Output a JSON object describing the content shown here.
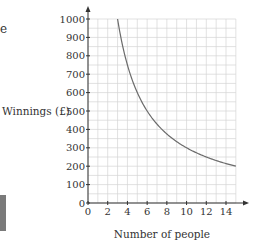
{
  "fragments": {
    "top_left_text": "e"
  },
  "chart_data": {
    "type": "line",
    "title": "",
    "xlabel": "Number of people",
    "ylabel": "Winnings (£)",
    "xlim": [
      0,
      15
    ],
    "ylim": [
      0,
      1000
    ],
    "xticks": [
      0,
      2,
      4,
      6,
      8,
      10,
      12,
      14
    ],
    "yticks": [
      0,
      100,
      200,
      300,
      400,
      500,
      600,
      700,
      800,
      900,
      1000
    ],
    "grid": true,
    "grid_minor": {
      "x_step": 1,
      "y_step": 50
    },
    "legend": null,
    "series": [
      {
        "name": "Winnings = 3000 / people",
        "color": "#6b6b6b",
        "x": [
          3,
          3.5,
          4,
          4.5,
          5,
          6,
          7,
          8,
          9,
          10,
          11,
          12,
          13,
          14,
          15
        ],
        "y": [
          1000,
          857,
          750,
          667,
          600,
          500,
          429,
          375,
          333,
          300,
          273,
          250,
          231,
          214,
          200
        ]
      }
    ]
  },
  "style": {
    "grid_color": "#d4d4d4",
    "axis_color": "#333333",
    "text_color": "#333333"
  }
}
